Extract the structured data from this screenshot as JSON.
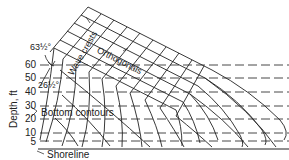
{
  "diagram": {
    "type": "wave refraction diagram",
    "y_axis_label": "Depth, ft",
    "depth_ticks": [
      "60",
      "50",
      "40",
      "30",
      "20",
      "10",
      "5"
    ],
    "labels": {
      "wave_crests": "Wave crests",
      "orthogonals": "Orthogonals",
      "bottom_contours": "Bottom contours",
      "shoreline": "Shoreline",
      "angle_top": "63½°",
      "angle_bottom": "26½°"
    },
    "colors": {
      "line": "#222222",
      "background": "#ffffff"
    }
  }
}
